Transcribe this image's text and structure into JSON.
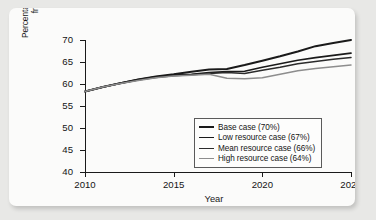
{
  "chart_data": {
    "type": "line",
    "title": "",
    "xlabel": "Year",
    "ylabel_lines": [
      "Percentage of U.S. oil consumption",
      "from foreign suppliers"
    ],
    "xlim": [
      2010,
      2025
    ],
    "ylim": [
      40,
      70
    ],
    "xticks": [
      "2010",
      "2015",
      "2020",
      "2025"
    ],
    "yticks": [
      "40",
      "45",
      "50",
      "55",
      "60",
      "65",
      "70"
    ],
    "grid": false,
    "legend_position": "lower-right inside plot",
    "x": [
      2010,
      2011,
      2012,
      2013,
      2014,
      2015,
      2016,
      2017,
      2018,
      2019,
      2020,
      2021,
      2022,
      2023,
      2024,
      2025
    ],
    "series": [
      {
        "name": "Base case (70%)",
        "final_value": 70,
        "color": "#1a1a1a",
        "width": 2.0,
        "values": [
          58.3,
          59.3,
          60.2,
          61.0,
          61.7,
          62.2,
          62.8,
          63.3,
          63.4,
          64.3,
          65.3,
          66.3,
          67.4,
          68.6,
          69.3,
          70.0
        ]
      },
      {
        "name": "Low resource case (67%)",
        "final_value": 67,
        "color": "#1a1a1a",
        "width": 1.7,
        "values": [
          58.3,
          59.3,
          60.2,
          61.0,
          61.6,
          62.0,
          62.2,
          62.6,
          62.8,
          62.9,
          63.8,
          64.6,
          65.4,
          66.0,
          66.5,
          67.0
        ]
      },
      {
        "name": "Mean resource case (66%)",
        "final_value": 66,
        "color": "#2b2b2b",
        "width": 1.5,
        "values": [
          58.3,
          59.3,
          60.1,
          60.9,
          61.5,
          61.9,
          62.1,
          62.4,
          62.6,
          62.4,
          63.1,
          63.8,
          64.6,
          65.1,
          65.6,
          66.0
        ]
      },
      {
        "name": "High resource case (64%)",
        "final_value": 64,
        "color": "#8d8d8d",
        "width": 1.5,
        "values": [
          58.3,
          59.3,
          60.1,
          60.8,
          61.4,
          61.8,
          62.0,
          62.2,
          61.3,
          61.2,
          61.4,
          62.2,
          63.0,
          63.5,
          63.9,
          64.3
        ]
      }
    ]
  },
  "legend": {
    "entries": [
      {
        "label": "Base case (70%)"
      },
      {
        "label": "Low resource case (67%)"
      },
      {
        "label": "Mean resource case (66%)"
      },
      {
        "label": "High resource case (64%)"
      }
    ]
  }
}
